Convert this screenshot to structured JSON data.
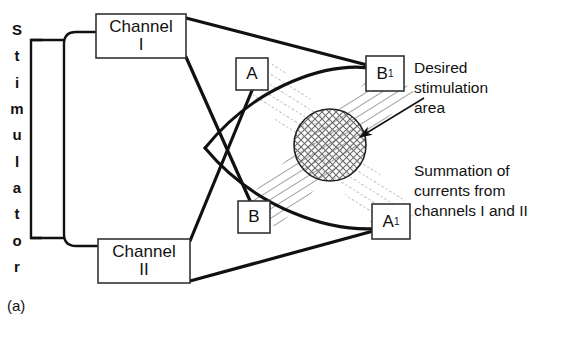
{
  "figure": {
    "label": "(a)",
    "stimulator_label": "Stimulator",
    "stimulator_letters": [
      "S",
      "t",
      "i",
      "m",
      "u",
      "l",
      "a",
      "t",
      "o",
      "r"
    ]
  },
  "channels": [
    {
      "name": "channel-1",
      "line1": "Channel",
      "line2": "I"
    },
    {
      "name": "channel-2",
      "line1": "Channel",
      "line2": "II"
    }
  ],
  "electrodes": [
    {
      "name": "electrode-a",
      "label": "A",
      "sup": ""
    },
    {
      "name": "electrode-b",
      "label": "B",
      "sup": ""
    },
    {
      "name": "electrode-a1",
      "label": "A",
      "sup": "1"
    },
    {
      "name": "electrode-b1",
      "label": "B",
      "sup": "1"
    }
  ],
  "annotations": {
    "desired": {
      "line1": "Desired",
      "line2": "stimulation",
      "line3": "area"
    },
    "summation": {
      "line1": "Summation of",
      "line2": "currents from",
      "line3": "channels I and II"
    }
  },
  "colors": {
    "ink": "#111111",
    "hatch_solid": "#555555",
    "hatch_dotted": "#9a9a9a",
    "box_border": "#333333",
    "background": "#ffffff"
  },
  "geometry": {
    "circle_center_x": 330,
    "circle_center_y": 145,
    "circle_radius": 36
  }
}
